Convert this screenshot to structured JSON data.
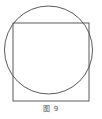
{
  "figure": {
    "caption": "图 9",
    "background_color": "#ffffff",
    "stroke_color": "#4a4a4a",
    "caption_color": "#555555"
  },
  "diagram_data": {
    "type": "geometry",
    "description": "A square overlapping a circle; the square's top side lies inside the circle while its lower corners extend outside the circle.",
    "shapes": [
      {
        "name": "circle",
        "kind": "circle",
        "cx": 48.5,
        "cy": 50.0,
        "r": 44.0,
        "stroke": "#4a4a4a",
        "stroke_width": 0.9,
        "fill": "none"
      },
      {
        "name": "square",
        "kind": "rect",
        "x": 13.0,
        "y": 23.0,
        "width": 76.0,
        "height": 78.0,
        "stroke": "#4a4a4a",
        "stroke_width": 0.9,
        "fill": "none"
      }
    ]
  }
}
